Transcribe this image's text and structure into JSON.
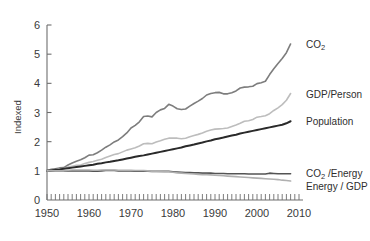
{
  "chart_data": {
    "type": "line",
    "title": "",
    "xlabel": "",
    "ylabel": "Indexed",
    "xlim": [
      1950,
      2010
    ],
    "ylim": [
      0,
      6
    ],
    "grid": false,
    "legend_position": "right-inline-labels",
    "x_tick_labels": [
      "1950",
      "1960",
      "1970",
      "1980",
      "1990",
      "2000",
      "2010"
    ],
    "x_ticks": [
      1950,
      1960,
      1970,
      1980,
      1990,
      2000,
      2010
    ],
    "y_tick_labels": [
      "0",
      "1",
      "2",
      "3",
      "4",
      "5",
      "6"
    ],
    "y_ticks": [
      0,
      1,
      2,
      3,
      4,
      5,
      6
    ],
    "minor_x_tick_interval": 1,
    "note": "All series indexed to 1.0 in 1950 (Kaya identity decomposition)",
    "x": [
      1950,
      1951,
      1952,
      1953,
      1954,
      1955,
      1956,
      1957,
      1958,
      1959,
      1960,
      1961,
      1962,
      1963,
      1964,
      1965,
      1966,
      1967,
      1968,
      1969,
      1970,
      1971,
      1972,
      1973,
      1974,
      1975,
      1976,
      1977,
      1978,
      1979,
      1980,
      1981,
      1982,
      1983,
      1984,
      1985,
      1986,
      1987,
      1988,
      1989,
      1990,
      1991,
      1992,
      1993,
      1994,
      1995,
      1996,
      1997,
      1998,
      1999,
      2000,
      2001,
      2002,
      2003,
      2004,
      2005,
      2006,
      2007,
      2008
    ],
    "series": [
      {
        "name": "CO2",
        "label": "CO₂",
        "color": "#7d7d7d",
        "width": 1.6,
        "end_value": 5.35,
        "values": [
          1.0,
          1.05,
          1.07,
          1.1,
          1.11,
          1.2,
          1.27,
          1.33,
          1.38,
          1.45,
          1.54,
          1.55,
          1.62,
          1.71,
          1.81,
          1.89,
          1.99,
          2.06,
          2.17,
          2.3,
          2.47,
          2.56,
          2.68,
          2.86,
          2.88,
          2.85,
          3.0,
          3.09,
          3.14,
          3.28,
          3.22,
          3.13,
          3.1,
          3.12,
          3.22,
          3.31,
          3.39,
          3.48,
          3.6,
          3.65,
          3.68,
          3.69,
          3.64,
          3.64,
          3.68,
          3.74,
          3.84,
          3.87,
          3.88,
          3.9,
          3.99,
          4.02,
          4.07,
          4.3,
          4.5,
          4.68,
          4.85,
          5.05,
          5.35
        ]
      },
      {
        "name": "GDP/Person",
        "label": "GDP/Person",
        "color": "#bdbdbd",
        "width": 1.6,
        "end_value": 3.65,
        "values": [
          1.0,
          1.02,
          1.04,
          1.07,
          1.08,
          1.13,
          1.16,
          1.19,
          1.2,
          1.25,
          1.29,
          1.32,
          1.36,
          1.4,
          1.46,
          1.51,
          1.56,
          1.59,
          1.65,
          1.71,
          1.75,
          1.79,
          1.85,
          1.93,
          1.94,
          1.93,
          1.99,
          2.03,
          2.08,
          2.12,
          2.12,
          2.12,
          2.1,
          2.12,
          2.17,
          2.21,
          2.25,
          2.3,
          2.36,
          2.4,
          2.43,
          2.44,
          2.45,
          2.47,
          2.52,
          2.57,
          2.63,
          2.7,
          2.72,
          2.76,
          2.84,
          2.86,
          2.89,
          2.96,
          3.07,
          3.16,
          3.27,
          3.42,
          3.65
        ]
      },
      {
        "name": "Population",
        "label": "Population",
        "color": "#2a2a2a",
        "width": 2.0,
        "end_value": 2.7,
        "values": [
          1.0,
          1.02,
          1.04,
          1.05,
          1.07,
          1.09,
          1.11,
          1.13,
          1.15,
          1.17,
          1.19,
          1.21,
          1.24,
          1.26,
          1.29,
          1.31,
          1.34,
          1.36,
          1.39,
          1.42,
          1.45,
          1.48,
          1.51,
          1.53,
          1.56,
          1.59,
          1.62,
          1.65,
          1.68,
          1.71,
          1.74,
          1.77,
          1.8,
          1.84,
          1.87,
          1.9,
          1.94,
          1.97,
          2.01,
          2.04,
          2.08,
          2.11,
          2.14,
          2.18,
          2.21,
          2.24,
          2.28,
          2.31,
          2.34,
          2.37,
          2.4,
          2.43,
          2.46,
          2.49,
          2.52,
          2.55,
          2.58,
          2.63,
          2.7
        ]
      },
      {
        "name": "CO2/Energy",
        "label": "CO₂ /Energy",
        "color": "#545454",
        "width": 1.6,
        "end_value": 0.9,
        "values": [
          1.0,
          1.0,
          1.0,
          1.0,
          1.0,
          1.0,
          1.0,
          1.0,
          1.0,
          1.0,
          1.0,
          0.99,
          0.99,
          1.0,
          1.01,
          1.01,
          1.01,
          1.0,
          1.0,
          1.0,
          1.0,
          0.99,
          0.99,
          0.99,
          0.99,
          0.98,
          0.98,
          0.98,
          0.98,
          0.98,
          0.97,
          0.96,
          0.95,
          0.94,
          0.94,
          0.93,
          0.93,
          0.92,
          0.92,
          0.92,
          0.91,
          0.91,
          0.91,
          0.9,
          0.9,
          0.9,
          0.9,
          0.9,
          0.89,
          0.89,
          0.89,
          0.89,
          0.89,
          0.92,
          0.91,
          0.9,
          0.9,
          0.9,
          0.9
        ]
      },
      {
        "name": "Energy/GDP",
        "label": "Energy / GDP",
        "color": "#b0b0b0",
        "width": 1.6,
        "end_value": 0.65,
        "values": [
          1.0,
          1.01,
          1.0,
          1.0,
          1.0,
          1.02,
          1.03,
          1.03,
          1.03,
          1.03,
          1.03,
          1.02,
          1.02,
          1.03,
          1.03,
          1.03,
          1.03,
          1.02,
          1.02,
          1.02,
          1.02,
          1.01,
          1.01,
          1.01,
          1.0,
          0.99,
          0.99,
          0.98,
          0.97,
          0.97,
          0.95,
          0.93,
          0.92,
          0.91,
          0.9,
          0.89,
          0.88,
          0.87,
          0.87,
          0.86,
          0.85,
          0.84,
          0.83,
          0.82,
          0.81,
          0.8,
          0.79,
          0.78,
          0.77,
          0.76,
          0.75,
          0.74,
          0.73,
          0.72,
          0.71,
          0.7,
          0.68,
          0.67,
          0.65
        ]
      }
    ]
  },
  "labels": {
    "co2": "CO₂",
    "gdp_person": "GDP/Person",
    "population": "Population",
    "co2_energy_main": "CO₂ /Energy",
    "energy_gdp": "Energy / GDP",
    "y_axis_title": "Indexed"
  }
}
